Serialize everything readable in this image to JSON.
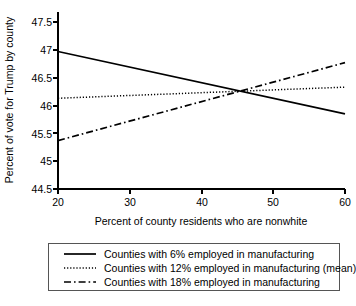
{
  "chart_data": {
    "type": "line",
    "title": "",
    "xlabel": "Percent of county residents who are nonwhite",
    "ylabel": "Percent of vote for Trump by county",
    "xlim": [
      20,
      60
    ],
    "ylim": [
      44.5,
      47.5
    ],
    "xticks": [
      20,
      30,
      40,
      50,
      60
    ],
    "xtick_labels": [
      "20",
      "30",
      "40",
      "50",
      "60"
    ],
    "yticks": [
      44.5,
      45,
      45.5,
      46,
      46.5,
      47,
      47.5
    ],
    "ytick_labels": [
      "44.5",
      "45",
      "45.5",
      "46",
      "46.5",
      "47",
      "47.5"
    ],
    "grid": false,
    "legend_position": "below",
    "x": [
      20,
      60
    ],
    "series": [
      {
        "name": "Counties with 6% employed in manufacturing",
        "style": "solid",
        "values": [
          46.97,
          45.85
        ]
      },
      {
        "name": "Counties with 12% employed in manufacturing (mean)",
        "style": "dotted",
        "values": [
          46.13,
          46.33
        ]
      },
      {
        "name": "Counties with 18% employed in manufacturing",
        "style": "dash-dot",
        "values": [
          45.37,
          46.77
        ]
      }
    ],
    "annotations": [
      {
        "text": "lines intersect near 45% nonwhite at about 46.25 percent of vote",
        "x": 45,
        "y": 46.25
      }
    ]
  },
  "legend": {
    "entries": [
      {
        "label": "Counties with 6% employed in manufacturing",
        "sample": "solid-line-sample"
      },
      {
        "label": "Counties with 12% employed in manufacturing (mean)",
        "sample": "dotted-line-sample"
      },
      {
        "label": "Counties with 18% employed in manufacturing",
        "sample": "dash-dot-line-sample"
      }
    ]
  },
  "colors": {
    "line": "#000000",
    "axis": "#000000",
    "background": "#ffffff",
    "legend_border": "#555555"
  }
}
